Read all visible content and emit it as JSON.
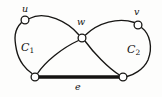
{
  "figure": {
    "kind": "graph-diagram",
    "width": 162,
    "height": 97,
    "background_color": "#fdfdfc",
    "ink_color": "#171614"
  },
  "labels": {
    "u": "u",
    "w": "w",
    "v": "v",
    "c1_base": "C",
    "c1_sub": "1",
    "c2_base": "C",
    "c2_sub": "2",
    "e": "e"
  },
  "graph": {
    "vertices": [
      {
        "id": "u",
        "label": "u",
        "x": 25,
        "y": 20
      },
      {
        "id": "w",
        "label": "w",
        "x": 82,
        "y": 38
      },
      {
        "id": "v",
        "label": "v",
        "x": 138,
        "y": 25
      },
      {
        "id": "a",
        "label": "",
        "x": 35,
        "y": 77
      },
      {
        "id": "b",
        "label": "",
        "x": 123,
        "y": 77
      }
    ],
    "edges": [
      {
        "from": "u",
        "to": "w",
        "style": "curve",
        "weight": "thin"
      },
      {
        "from": "u",
        "to": "a",
        "style": "curve",
        "weight": "thin"
      },
      {
        "from": "a",
        "to": "w",
        "style": "curve",
        "weight": "thin"
      },
      {
        "from": "w",
        "to": "v",
        "style": "curve",
        "weight": "thin"
      },
      {
        "from": "v",
        "to": "b",
        "style": "curve",
        "weight": "thin"
      },
      {
        "from": "w",
        "to": "b",
        "style": "curve",
        "weight": "thin"
      },
      {
        "from": "a",
        "to": "b",
        "style": "straight",
        "weight": "bold",
        "label": "e"
      }
    ],
    "regions": [
      {
        "id": "C1",
        "label": "C",
        "subscript": "1",
        "x": 27,
        "y": 48
      },
      {
        "id": "C2",
        "label": "C",
        "subscript": "2",
        "x": 134,
        "y": 50
      }
    ]
  }
}
